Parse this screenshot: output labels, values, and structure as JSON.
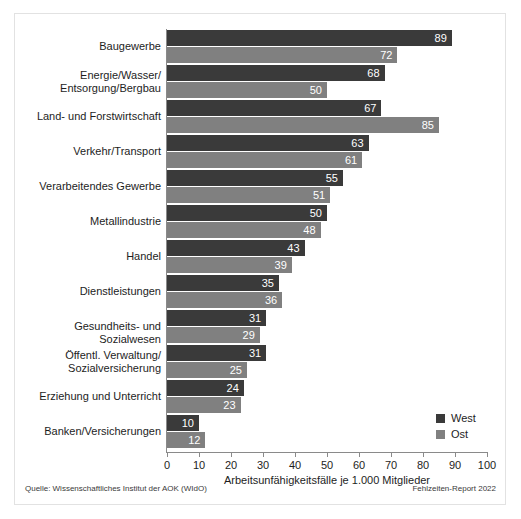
{
  "chart_data": {
    "type": "bar",
    "orientation": "horizontal",
    "title": "",
    "xlabel": "Arbeitsunfähigkeitsfälle je 1.000 Mitglieder",
    "ylabel": "",
    "xlim": [
      0,
      100
    ],
    "xticks": [
      0,
      10,
      20,
      30,
      40,
      50,
      60,
      70,
      80,
      90,
      100
    ],
    "xtick_labels": [
      "0",
      "10",
      "20",
      "30",
      "40",
      "50",
      "60",
      "70",
      "80",
      "90",
      "100"
    ],
    "grid": false,
    "legend_position": "bottom-right",
    "categories": [
      "Baugewerbe",
      "Energie/Wasser/\nEntsorgung/Bergbau",
      "Land- und Forstwirtschaft",
      "Verkehr/Transport",
      "Verarbeitendes Gewerbe",
      "Metallindustrie",
      "Handel",
      "Dienstleistungen",
      "Gesundheits- und Sozialwesen",
      "Öffentl. Verwaltung/\nSozialversicherung",
      "Erziehung und Unterricht",
      "Banken/Versicherungen"
    ],
    "series": [
      {
        "name": "West",
        "color": "#3a3a3a",
        "values": [
          89,
          68,
          67,
          63,
          55,
          50,
          43,
          35,
          31,
          31,
          24,
          10
        ]
      },
      {
        "name": "Ost",
        "color": "#808080",
        "values": [
          72,
          50,
          85,
          61,
          51,
          48,
          39,
          36,
          29,
          25,
          23,
          12
        ]
      }
    ]
  },
  "categories_display": [
    {
      "lines": [
        "Baugewerbe"
      ]
    },
    {
      "lines": [
        "Energie/Wasser/",
        "Entsorgung/Bergbau"
      ]
    },
    {
      "lines": [
        "Land- und Forstwirtschaft"
      ]
    },
    {
      "lines": [
        "Verkehr/Transport"
      ]
    },
    {
      "lines": [
        "Verarbeitendes Gewerbe"
      ]
    },
    {
      "lines": [
        "Metallindustrie"
      ]
    },
    {
      "lines": [
        "Handel"
      ]
    },
    {
      "lines": [
        "Dienstleistungen"
      ]
    },
    {
      "lines": [
        "Gesundheits- und Sozialwesen"
      ]
    },
    {
      "lines": [
        "Öffentl. Verwaltung/",
        "Sozialversicherung"
      ]
    },
    {
      "lines": [
        "Erziehung und Unterricht"
      ]
    },
    {
      "lines": [
        "Banken/Versicherungen"
      ]
    }
  ],
  "legend": {
    "entries": [
      {
        "label": "West",
        "color": "#3a3a3a"
      },
      {
        "label": "Ost",
        "color": "#808080"
      }
    ]
  },
  "axis": {
    "x_title": "Arbeitsunfähigkeitsfälle je 1.000 Mitglieder"
  },
  "footer": {
    "source": "Quelle: Wissenschaftliches Institut der AOK (WIdO)",
    "report": "Fehlzeiten-Report 2022"
  },
  "colors": {
    "west": "#3a3a3a",
    "ost": "#808080",
    "axis": "#8a8a8a",
    "frame": "#e2e2e2",
    "text": "#1d1d1d",
    "background": "#ffffff"
  }
}
